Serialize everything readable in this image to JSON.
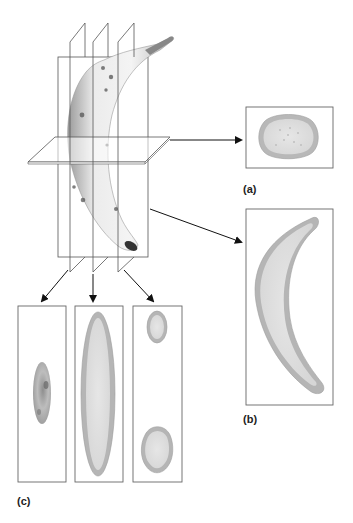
{
  "figure": {
    "labels": {
      "a": "(a)",
      "b": "(b)",
      "c": "(c)"
    },
    "panels": [
      {
        "id": "a",
        "label": "(a)",
        "section": "transverse cross-section (oval ring)"
      },
      {
        "id": "b",
        "label": "(b)",
        "section": "longitudinal section (crescent)"
      },
      {
        "id": "c",
        "label": "(c)",
        "section": "three parallel vertical sections",
        "sub_panels": [
          "grazing cut through skin (small dark oval)",
          "central cut (long ellipse)",
          "off-center cut (two small ovals, top and bottom)"
        ]
      }
    ],
    "colors": {
      "outline": "#555555",
      "arrow": "#111111",
      "skin_ring": "#b5b5b5",
      "flesh": "#dcdcdc",
      "banana_body": "#e8e8e8",
      "spots": "#444444"
    }
  }
}
